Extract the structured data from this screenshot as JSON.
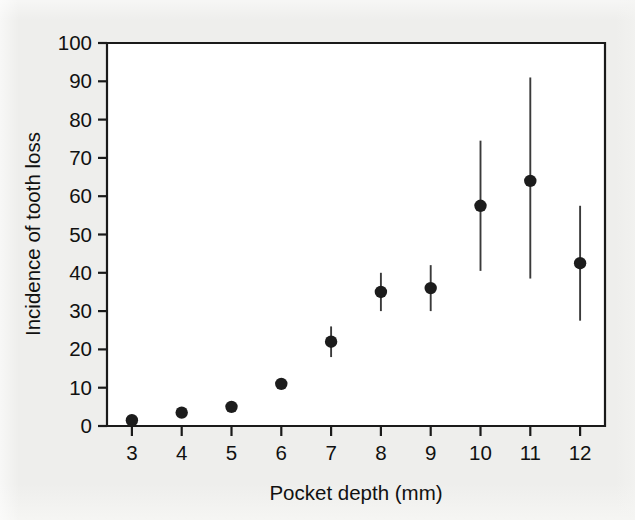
{
  "chart_data": {
    "type": "scatter",
    "title": "",
    "xlabel": "Pocket depth (mm)",
    "ylabel": "Incidence of tooth loss",
    "xlim": [
      2.5,
      12.5
    ],
    "ylim": [
      0,
      100
    ],
    "xticks": [
      3,
      4,
      5,
      6,
      7,
      8,
      9,
      10,
      11,
      12
    ],
    "xtick_labels": [
      "3",
      "4",
      "5",
      "6",
      "7",
      "8",
      "9",
      "10",
      "11",
      "12"
    ],
    "yticks": [
      0,
      10,
      20,
      30,
      40,
      50,
      60,
      70,
      80,
      90,
      100
    ],
    "ytick_labels": [
      "0",
      "10",
      "20",
      "30",
      "40",
      "50",
      "60",
      "70",
      "80",
      "90",
      "100"
    ],
    "grid": false,
    "legend": null,
    "marker": "filled-circle",
    "error_bars": "vertical",
    "x": [
      3,
      4,
      5,
      6,
      7,
      8,
      9,
      10,
      11,
      12
    ],
    "values": [
      1.5,
      3.5,
      5,
      11,
      22,
      35,
      36,
      57.5,
      64,
      42.5
    ],
    "error_low": [
      1.5,
      3.5,
      5,
      11,
      18,
      30,
      30,
      40.5,
      38.5,
      27.5
    ],
    "error_high": [
      1.5,
      3.5,
      5,
      11,
      26,
      40,
      42,
      74.5,
      91,
      57.5
    ],
    "points": [
      {
        "x": 3,
        "y": 1.5,
        "lo": 1.5,
        "hi": 1.5
      },
      {
        "x": 4,
        "y": 3.5,
        "lo": 3.5,
        "hi": 3.5
      },
      {
        "x": 5,
        "y": 5,
        "lo": 5,
        "hi": 5
      },
      {
        "x": 6,
        "y": 11,
        "lo": 11,
        "hi": 11
      },
      {
        "x": 7,
        "y": 22,
        "lo": 18,
        "hi": 26
      },
      {
        "x": 8,
        "y": 35,
        "lo": 30,
        "hi": 40
      },
      {
        "x": 9,
        "y": 36,
        "lo": 30,
        "hi": 42
      },
      {
        "x": 10,
        "y": 57.5,
        "lo": 40.5,
        "hi": 74.5
      },
      {
        "x": 11,
        "y": 64,
        "lo": 38.5,
        "hi": 91
      },
      {
        "x": 12,
        "y": 42.5,
        "lo": 27.5,
        "hi": 57.5
      }
    ],
    "colors": {
      "marker": "#1c1c1c",
      "errorbar": "#3a3a3a",
      "axis": "#1a1a1a",
      "plot_background": "#ffffff",
      "figure_background": "#eeeeec",
      "text": "#111111"
    }
  }
}
